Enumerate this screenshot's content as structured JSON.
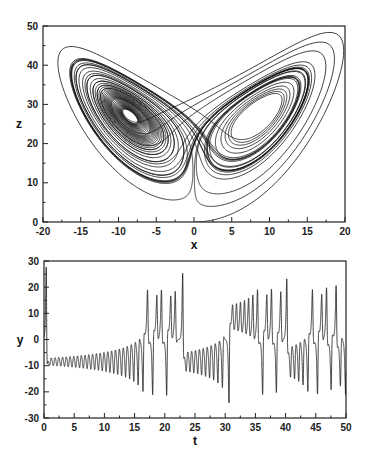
{
  "chart_data": [
    {
      "type": "line",
      "title": "",
      "description": "Lorenz attractor projection onto x-z plane",
      "xlabel": "x",
      "ylabel": "z",
      "xlim": [
        -20,
        20
      ],
      "ylim": [
        0,
        50
      ],
      "xticks": [
        -20,
        -15,
        -10,
        -5,
        0,
        5,
        10,
        15,
        20
      ],
      "yticks": [
        0,
        10,
        20,
        30,
        40,
        50
      ],
      "minor_ticks": true,
      "grid": false,
      "legend": null,
      "series": [
        {
          "name": "trajectory",
          "model": "lorenz",
          "params": {
            "sigma": 10,
            "rho": 28,
            "beta": 2.6667
          },
          "initial": {
            "x": 0.0,
            "y": 1.0,
            "z": 0.0
          },
          "t_range": [
            0,
            50
          ],
          "features": {
            "left_wing_center": [
              -8.5,
              27
            ],
            "right_wing_center": [
              8.5,
              27
            ],
            "outer_loop_max": [
              19,
              47
            ],
            "start_point": [
              0,
              0
            ]
          }
        }
      ]
    },
    {
      "type": "line",
      "title": "",
      "description": "Time series of y component",
      "xlabel": "t",
      "ylabel": "y",
      "xlim": [
        0,
        50
      ],
      "ylim": [
        -30,
        30
      ],
      "xticks": [
        0,
        5,
        10,
        15,
        20,
        25,
        30,
        35,
        40,
        45,
        50
      ],
      "yticks": [
        -30,
        -20,
        -10,
        0,
        10,
        20,
        30
      ],
      "minor_ticks": true,
      "grid": false,
      "legend": null,
      "series": [
        {
          "name": "y(t)",
          "model": "lorenz",
          "params": {
            "sigma": 10,
            "rho": 28,
            "beta": 2.6667
          },
          "initial": {
            "x": 0.0,
            "y": 1.0,
            "z": 0.0
          },
          "t_range": [
            0,
            50
          ],
          "features": {
            "initial_spike": {
              "t": 0.4,
              "y": 27
            },
            "damped_oscillation_center": -8.5,
            "oscillation_growth_until_t": 17,
            "first_large_dip": {
              "t": 16.8,
              "y": -22
            },
            "notable_peaks": [
              [
                19.6,
                21
              ],
              [
                22.0,
                21
              ],
              [
                31.5,
                22
              ],
              [
                48,
                23
              ]
            ],
            "notable_troughs": [
              [
                16.8,
                -22
              ],
              [
                27.5,
                -23
              ],
              [
                35,
                -23
              ],
              [
                39.5,
                -20
              ]
            ]
          }
        }
      ]
    }
  ],
  "layout": {
    "top_plot": {
      "left": 43,
      "top": 26,
      "right": 345,
      "bottom": 222
    },
    "bottom_plot": {
      "left": 44,
      "top": 261,
      "right": 346,
      "bottom": 418
    },
    "line_color": "#111111",
    "frame_color": "#222222"
  },
  "labels": {
    "top_x": "x",
    "top_y": "z",
    "bottom_x": "t",
    "bottom_y": "y"
  }
}
